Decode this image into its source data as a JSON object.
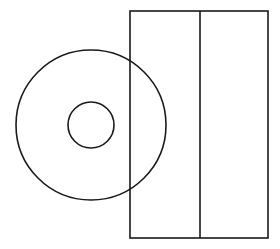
{
  "diagram": {
    "stroke_color": "#1a1a1a",
    "background_color": "#ffffff",
    "case": {
      "x": 130,
      "y": 11,
      "width": 138,
      "height": 227,
      "divider_x": 200
    },
    "disc": {
      "cx": 91,
      "cy": 125,
      "outer_radius": 75,
      "inner_radius": 23
    }
  }
}
